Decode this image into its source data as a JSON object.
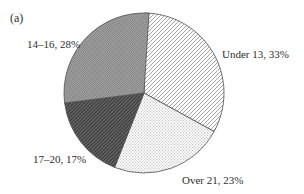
{
  "figure": {
    "panel_label": "(a)"
  },
  "chart_data": {
    "type": "pie",
    "title": "",
    "start_angle_deg": 0,
    "direction": "clockwise",
    "slices": [
      {
        "label": "Under 13",
        "value_pct": 33,
        "display": "Under 13, 33%",
        "pattern": "diagonal-light"
      },
      {
        "label": "Over 21",
        "value_pct": 23,
        "display": "Over 21, 23%",
        "pattern": "stipple-light"
      },
      {
        "label": "17–20",
        "value_pct": 17,
        "display": "17–20, 17%",
        "pattern": "diagonal-dark"
      },
      {
        "label": "14–16",
        "value_pct": 28,
        "display": "14–16, 28%",
        "pattern": "crosshatch-gray"
      }
    ],
    "legend": "none",
    "labels_position": "outside",
    "colors": {
      "outline": "#4f4f4f",
      "background": "#ffffff",
      "text": "#2e2e2e",
      "hatch_light_line": "#8f8f8f",
      "stipple_dot": "#c4c4c4",
      "dark_fill": "#3b3b3b",
      "dark_hatch_line": "#7a7a7a",
      "gray_check_dark": "#757575",
      "gray_check_light": "#b2b2b2"
    }
  }
}
